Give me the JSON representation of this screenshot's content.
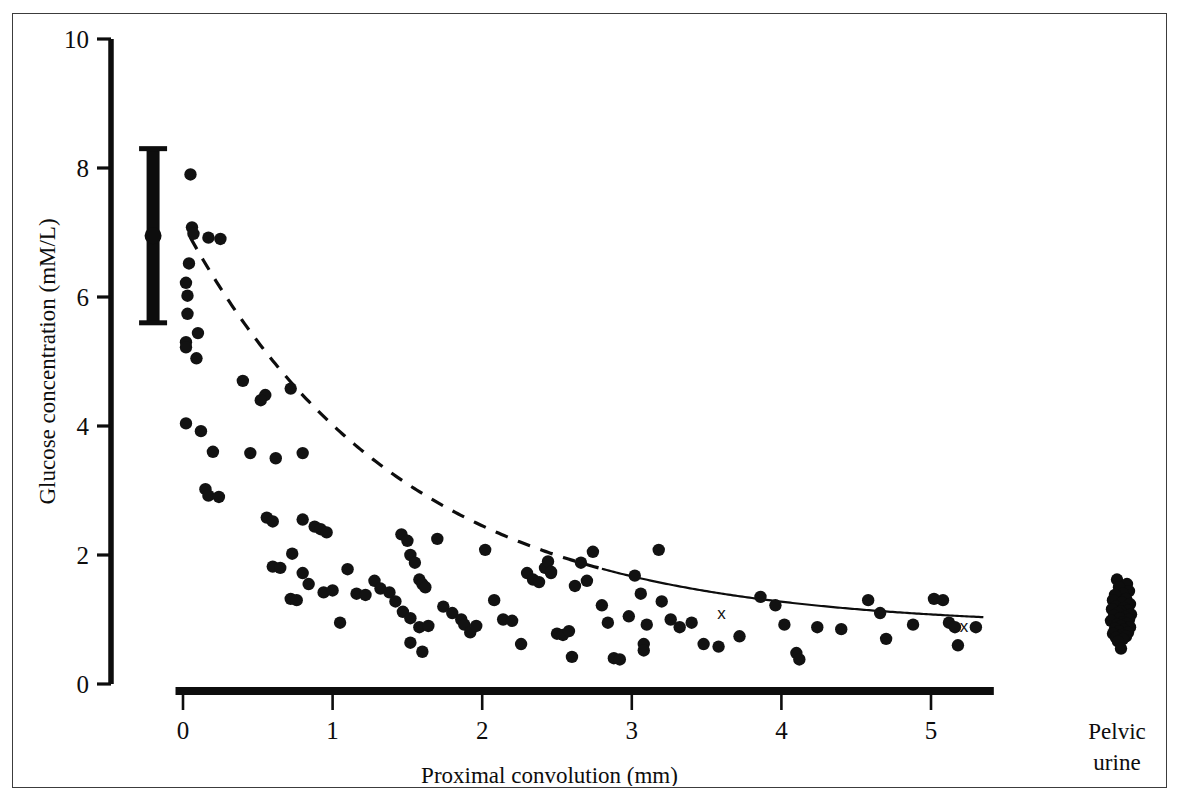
{
  "figure": {
    "background_color": "#ffffff",
    "frame_color": "#3c3c3c",
    "ink_color": "#0d0d0d"
  },
  "chart_data": {
    "type": "scatter",
    "title": "",
    "xlabel": "Proximal convolution (mm)",
    "ylabel": "Glucose concentration (mM/L)",
    "xlim": [
      -0.35,
      5.55
    ],
    "ylim": [
      0,
      10
    ],
    "xticks": [
      0,
      1,
      2,
      3,
      4,
      5
    ],
    "xtick_labels": [
      "0",
      "1",
      "2",
      "3",
      "4",
      "5"
    ],
    "yticks": [
      0,
      2,
      4,
      6,
      8,
      10
    ],
    "ytick_labels": [
      "0",
      "2",
      "4",
      "6",
      "8",
      "10"
    ],
    "grid": false,
    "legend": null,
    "series": [
      {
        "name": "Proximal tubule glucose samples",
        "marker": "filled-circle",
        "marker_color": "#121212",
        "points": [
          [
            0.05,
            7.9
          ],
          [
            0.06,
            7.08
          ],
          [
            0.07,
            6.98
          ],
          [
            0.17,
            6.92
          ],
          [
            0.25,
            6.9
          ],
          [
            0.04,
            6.52
          ],
          [
            0.02,
            6.22
          ],
          [
            0.03,
            6.02
          ],
          [
            0.03,
            5.74
          ],
          [
            0.1,
            5.44
          ],
          [
            0.02,
            5.3
          ],
          [
            0.02,
            5.22
          ],
          [
            0.09,
            5.05
          ],
          [
            0.02,
            4.04
          ],
          [
            0.12,
            3.92
          ],
          [
            0.2,
            3.6
          ],
          [
            0.45,
            3.58
          ],
          [
            0.62,
            3.5
          ],
          [
            0.15,
            3.02
          ],
          [
            0.17,
            2.92
          ],
          [
            0.24,
            2.9
          ],
          [
            0.55,
            4.48
          ],
          [
            0.72,
            4.58
          ],
          [
            0.52,
            4.4
          ],
          [
            0.4,
            4.7
          ],
          [
            0.8,
            3.58
          ],
          [
            0.56,
            2.58
          ],
          [
            0.6,
            2.52
          ],
          [
            0.8,
            2.55
          ],
          [
            0.88,
            2.44
          ],
          [
            0.92,
            2.4
          ],
          [
            0.96,
            2.35
          ],
          [
            0.73,
            2.02
          ],
          [
            0.6,
            1.82
          ],
          [
            0.65,
            1.8
          ],
          [
            0.8,
            1.72
          ],
          [
            0.84,
            1.55
          ],
          [
            0.72,
            1.32
          ],
          [
            0.76,
            1.3
          ],
          [
            0.94,
            1.42
          ],
          [
            1.0,
            1.45
          ],
          [
            1.05,
            0.95
          ],
          [
            1.1,
            1.78
          ],
          [
            1.16,
            1.4
          ],
          [
            1.22,
            1.38
          ],
          [
            1.28,
            1.6
          ],
          [
            1.32,
            1.48
          ],
          [
            1.38,
            1.42
          ],
          [
            1.42,
            1.28
          ],
          [
            1.46,
            2.32
          ],
          [
            1.5,
            2.22
          ],
          [
            1.52,
            2.0
          ],
          [
            1.55,
            1.88
          ],
          [
            1.58,
            1.62
          ],
          [
            1.6,
            1.55
          ],
          [
            1.62,
            1.5
          ],
          [
            1.47,
            1.12
          ],
          [
            1.52,
            1.02
          ],
          [
            1.58,
            0.88
          ],
          [
            1.64,
            0.9
          ],
          [
            1.52,
            0.64
          ],
          [
            1.7,
            2.25
          ],
          [
            1.74,
            1.2
          ],
          [
            1.8,
            1.1
          ],
          [
            1.86,
            1.0
          ],
          [
            1.88,
            0.92
          ],
          [
            1.92,
            0.8
          ],
          [
            1.96,
            0.9
          ],
          [
            1.6,
            0.5
          ],
          [
            2.02,
            2.08
          ],
          [
            2.08,
            1.3
          ],
          [
            2.14,
            1.0
          ],
          [
            2.2,
            0.98
          ],
          [
            2.26,
            0.62
          ],
          [
            2.3,
            1.72
          ],
          [
            2.34,
            1.62
          ],
          [
            2.38,
            1.58
          ],
          [
            2.42,
            1.8
          ],
          [
            2.46,
            1.72
          ],
          [
            2.5,
            0.78
          ],
          [
            2.54,
            0.76
          ],
          [
            2.44,
            1.9
          ],
          [
            2.46,
            1.74
          ],
          [
            2.58,
            0.82
          ],
          [
            2.62,
            1.52
          ],
          [
            2.66,
            1.88
          ],
          [
            2.7,
            1.6
          ],
          [
            2.74,
            2.05
          ],
          [
            2.8,
            1.22
          ],
          [
            2.84,
            0.95
          ],
          [
            2.88,
            0.4
          ],
          [
            2.92,
            0.38
          ],
          [
            2.6,
            0.42
          ],
          [
            2.98,
            1.05
          ],
          [
            3.02,
            1.68
          ],
          [
            3.06,
            1.4
          ],
          [
            3.1,
            0.92
          ],
          [
            3.08,
            0.62
          ],
          [
            3.08,
            0.52
          ],
          [
            3.18,
            2.08
          ],
          [
            3.2,
            1.28
          ],
          [
            3.26,
            1.0
          ],
          [
            3.32,
            0.88
          ],
          [
            3.4,
            0.95
          ],
          [
            3.48,
            0.62
          ],
          [
            3.58,
            0.58
          ],
          [
            3.72,
            0.74
          ],
          [
            3.86,
            1.35
          ],
          [
            3.96,
            1.22
          ],
          [
            4.02,
            0.92
          ],
          [
            4.1,
            0.48
          ],
          [
            4.12,
            0.38
          ],
          [
            4.24,
            0.88
          ],
          [
            4.4,
            0.85
          ],
          [
            4.58,
            1.3
          ],
          [
            4.66,
            1.1
          ],
          [
            4.7,
            0.7
          ],
          [
            4.88,
            0.92
          ],
          [
            5.02,
            1.32
          ],
          [
            5.08,
            1.3
          ],
          [
            5.12,
            0.95
          ],
          [
            5.16,
            0.88
          ],
          [
            5.18,
            0.6
          ],
          [
            5.3,
            0.88
          ]
        ]
      },
      {
        "name": "Recollection samples",
        "marker": "x",
        "marker_color": "#121212",
        "points": [
          [
            2.52,
            0.8
          ],
          [
            3.6,
            1.1
          ],
          [
            5.22,
            0.9
          ]
        ]
      }
    ],
    "fit_curve": {
      "name": "Exponential decay fit",
      "style": "dashed-then-solid",
      "dashed_x_range": [
        0.05,
        2.8
      ],
      "solid_x_range": [
        2.8,
        5.35
      ],
      "asymptote": 0.88,
      "amplitude": 6.25,
      "decay_constant": 1.45,
      "points_note": "y = 0.88 + 6.25 * exp(-x / 1.45)"
    },
    "error_bar": {
      "name": "Plasma glucose mean +/- SD",
      "x": -0.2,
      "mean": 6.95,
      "upper": 8.3,
      "lower": 5.6,
      "style": "thick-bar-with-caps"
    },
    "side_group": {
      "label_line1": "Pelvic",
      "label_line2": "urine",
      "x_pixel_center": 1120,
      "values": [
        1.62,
        1.55,
        1.5,
        1.44,
        1.4,
        1.38,
        1.32,
        1.3,
        1.26,
        1.24,
        1.2,
        1.18,
        1.16,
        1.14,
        1.12,
        1.1,
        1.08,
        1.06,
        1.04,
        1.02,
        1.0,
        0.98,
        0.96,
        0.94,
        0.92,
        0.9,
        0.88,
        0.86,
        0.84,
        0.82,
        0.8,
        0.78,
        0.76,
        0.74,
        0.72,
        0.7,
        0.66,
        0.55
      ],
      "jitter": [
        -4,
        6,
        -2,
        8,
        2,
        -6,
        5,
        -8,
        1,
        9,
        -5,
        3,
        -9,
        7,
        0,
        -3,
        10,
        -7,
        4,
        -1,
        8,
        -10,
        2,
        6,
        -4,
        0,
        9,
        -6,
        3,
        -2,
        7,
        -8,
        1,
        5,
        -5,
        2,
        -3,
        0
      ]
    }
  }
}
